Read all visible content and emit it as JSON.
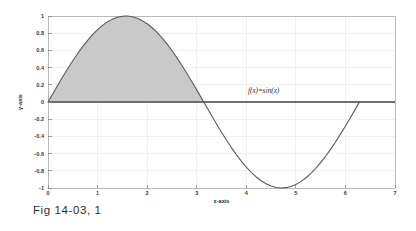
{
  "figure": {
    "caption": "Fig 14-03, 1",
    "annotation": "f(x)=sin(x)",
    "xlabel": "x-axis",
    "ylabel": "y-axis"
  },
  "colors": {
    "curve": "#5a5a5a",
    "fill": "#c9c9c9",
    "fill_edge": "#6b6b6b",
    "frame": "#b0b0b0",
    "grid": "#e6e6e6",
    "text": "#2f2f2f"
  },
  "chart_data": {
    "type": "line",
    "title": "",
    "subtitle": "",
    "xlabel": "x-axis",
    "ylabel": "y-axis",
    "xlim": [
      0,
      7
    ],
    "ylim": [
      -1,
      1
    ],
    "xticks": [
      0,
      1,
      2,
      3,
      4,
      5,
      6,
      7
    ],
    "xticklabels": [
      "0",
      "1",
      "2",
      "3",
      "4",
      "5",
      "6",
      "7"
    ],
    "yticks": [
      -1,
      -0.8,
      -0.6,
      -0.4,
      -0.2,
      0,
      0.2,
      0.4,
      0.6,
      0.8,
      1
    ],
    "yticklabels": [
      "-1",
      "-0.8",
      "-0.6",
      "-0.4",
      "-0.2",
      "0",
      "0.2",
      "0.4",
      "0.6",
      "0.8",
      "1"
    ],
    "grid": true,
    "legend": false,
    "annotations": [
      {
        "text": "f(x)=sin(x)",
        "x": 4.35,
        "y": 0.1
      }
    ],
    "fill_between": {
      "label": "area under sin(x) from 0 to pi",
      "x_start": 0,
      "x_end": 3.14159,
      "baseline": 0,
      "color": "#c9c9c9"
    },
    "series": [
      {
        "name": "sin(x)",
        "x": [
          0,
          0.1,
          0.2,
          0.3,
          0.4,
          0.5,
          0.6,
          0.7,
          0.8,
          0.9,
          1.0,
          1.1,
          1.2,
          1.3,
          1.4,
          1.5,
          1.5708,
          1.6,
          1.7,
          1.8,
          1.9,
          2.0,
          2.1,
          2.2,
          2.3,
          2.4,
          2.5,
          2.6,
          2.7,
          2.8,
          2.9,
          3.0,
          3.14159,
          3.2,
          3.3,
          3.4,
          3.5,
          3.6,
          3.7,
          3.8,
          3.9,
          4.0,
          4.1,
          4.2,
          4.3,
          4.4,
          4.5,
          4.6,
          4.7124,
          4.8,
          4.9,
          5.0,
          5.1,
          5.2,
          5.3,
          5.4,
          5.5,
          5.6,
          5.7,
          5.8,
          5.9,
          6.0,
          6.1,
          6.2,
          6.2832
        ],
        "y": [
          0,
          0.0998,
          0.1987,
          0.2955,
          0.3894,
          0.4794,
          0.5646,
          0.6442,
          0.7174,
          0.7833,
          0.8415,
          0.8912,
          0.932,
          0.9636,
          0.9854,
          0.9975,
          1.0,
          0.9996,
          0.9917,
          0.9738,
          0.9463,
          0.9093,
          0.8632,
          0.8085,
          0.7457,
          0.6755,
          0.5985,
          0.5155,
          0.4274,
          0.335,
          0.2392,
          0.1411,
          0.0,
          -0.0584,
          -0.1577,
          -0.2555,
          -0.3508,
          -0.4425,
          -0.5298,
          -0.6119,
          -0.6878,
          -0.7568,
          -0.8183,
          -0.8716,
          -0.9162,
          -0.9516,
          -0.9775,
          -0.9937,
          -1.0,
          -0.9962,
          -0.9825,
          -0.9589,
          -0.9258,
          -0.8835,
          -0.8323,
          -0.7728,
          -0.7055,
          -0.6313,
          -0.5507,
          -0.4646,
          -0.3739,
          -0.2794,
          -0.1822,
          -0.0831,
          0.0
        ]
      }
    ]
  }
}
